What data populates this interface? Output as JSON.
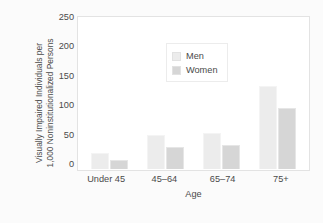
{
  "chart_data": {
    "type": "bar",
    "title": "",
    "subtitle": "",
    "xlabel": "Age",
    "ylabel": "Visually Impaired Individuals per 1,000 Noninstitutionalized Persons",
    "ylabel_line1": "Visually Impaired Individuals per",
    "ylabel_line2": "1,000 Noninstitutionalized Persons",
    "categories": [
      "Under 45",
      "45–64",
      "65–74",
      "75+"
    ],
    "series": [
      {
        "name": "Men",
        "values": [
          26,
          56,
          59,
          135
        ],
        "color": "#ececec"
      },
      {
        "name": "Women",
        "values": [
          14,
          36,
          40,
          99
        ],
        "color": "#d6d6d6"
      }
    ],
    "yticks": [
      250,
      200,
      150,
      100,
      50,
      0
    ],
    "ylim": [
      0,
      250
    ],
    "grid": false,
    "legend_position": "top-left",
    "legend_entries": [
      "Men",
      "Women"
    ]
  },
  "axis": {
    "y_tick_labels": [
      "250",
      "200",
      "150",
      "100",
      "50",
      "0"
    ],
    "x_tick_labels": [
      "Under 45",
      "45–64",
      "65–74",
      "75+"
    ],
    "x_title": "Age",
    "y_title_line1": "Visually Impaired Individuals per",
    "y_title_line2": "1,000 Noninstitutionalized Persons"
  },
  "legend": {
    "items": [
      {
        "label": "Men"
      },
      {
        "label": "Women"
      }
    ]
  },
  "colors": {
    "men_bar": "#ececec",
    "women_bar": "#d6d6d6",
    "plot_background": "#ffffff",
    "figure_background": "#fbfbfb",
    "frame": "#e3e3e3",
    "text": "#4a4a4a"
  }
}
